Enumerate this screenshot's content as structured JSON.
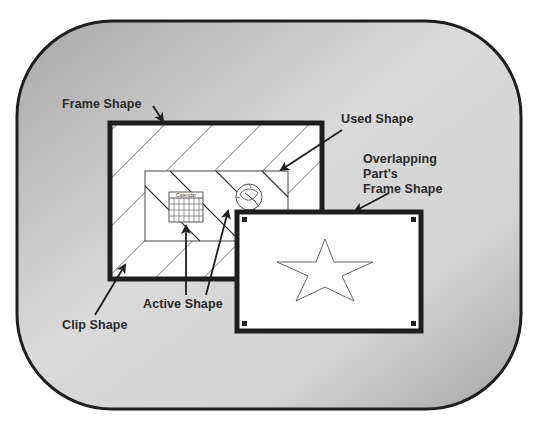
{
  "diagram": {
    "title": "",
    "colors": {
      "background": "#ffffff",
      "outer_fill_light": "#dcdcdc",
      "outer_fill_dark": "#a9a9a9",
      "stroke": "#1e1e1e",
      "shape_fill": "#ffffff",
      "hatch": "#333333"
    },
    "labels": {
      "frame_shape": "Frame Shape",
      "used_shape": "Used Shape",
      "overlapping_line1": "Overlapping",
      "overlapping_line2": "Part's",
      "overlapping_line3": "Frame Shape",
      "active_shape": "Active Shape",
      "clip_shape": "Clip Shape"
    },
    "icons": {
      "calendar": {
        "label": "Calendar",
        "name": "calendar-icon"
      },
      "clock": {
        "name": "clock-icon"
      },
      "star": {
        "name": "star-shape"
      }
    },
    "regions": {
      "outer_window": {
        "name": "document-window"
      },
      "frame": {
        "name": "frame-shape",
        "hatched": true
      },
      "used": {
        "name": "used-shape"
      },
      "overlap_frame": {
        "name": "overlapping-part-frame-shape",
        "handles": 4
      }
    }
  }
}
